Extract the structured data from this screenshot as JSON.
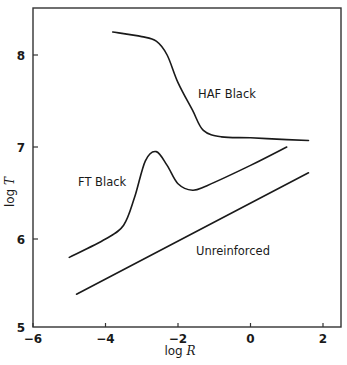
{
  "chart_data": {
    "type": "line",
    "title": "",
    "xlabel": "log R",
    "ylabel": "log T",
    "xlim": [
      -6,
      2.5
    ],
    "ylim": [
      5,
      8.5
    ],
    "x_ticks": [
      "-6",
      "-4",
      "-2",
      "0",
      "2"
    ],
    "y_ticks": [
      "5",
      "6",
      "7",
      "8"
    ],
    "grid": false,
    "legend": "inline curve labels",
    "series": [
      {
        "name": "HAF Black",
        "x": [
          -3.8,
          -3.0,
          -2.6,
          -2.3,
          -2.0,
          -1.6,
          -1.3,
          -0.8,
          0.0,
          1.0,
          1.6
        ],
        "y": [
          8.25,
          8.2,
          8.15,
          8.0,
          7.7,
          7.4,
          7.18,
          7.11,
          7.1,
          7.08,
          7.07
        ]
      },
      {
        "name": "FT Black",
        "x": [
          -5.0,
          -4.0,
          -3.5,
          -3.2,
          -2.9,
          -2.6,
          -2.3,
          -2.0,
          -1.6,
          -1.2,
          0.0,
          1.0
        ],
        "y": [
          5.8,
          6.0,
          6.15,
          6.45,
          6.85,
          6.95,
          6.8,
          6.6,
          6.53,
          6.58,
          6.8,
          7.0
        ]
      },
      {
        "name": "Unreinforced",
        "x": [
          -4.8,
          1.6
        ],
        "y": [
          5.4,
          6.72
        ]
      }
    ],
    "labels": {
      "haf": "HAF Black",
      "ft": "FT Black",
      "unreinforced": "Unreinforced"
    }
  }
}
